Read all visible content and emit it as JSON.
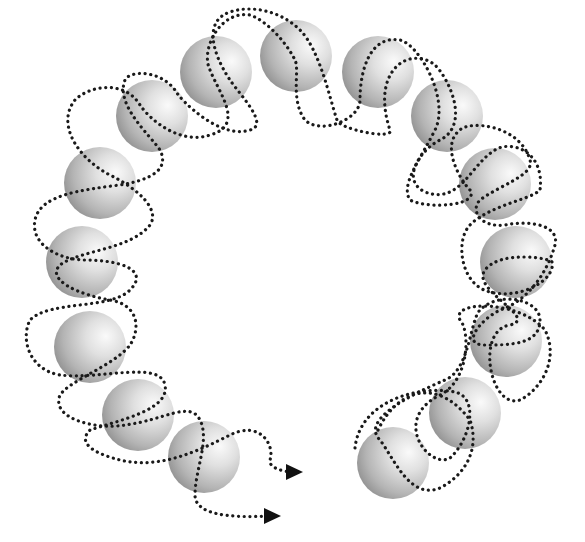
{
  "diagram": {
    "type": "open ring of beads with two dotted helical strands",
    "background": "#ffffff",
    "sphere": {
      "count": 15,
      "radius": 36,
      "highlight_color": "#f7f7f7",
      "mid_color": "#cfcfcf",
      "shadow_color": "#8e8e8e"
    },
    "spheres": [
      {
        "id": 1,
        "cx": 393,
        "cy": 463
      },
      {
        "id": 2,
        "cx": 465,
        "cy": 413
      },
      {
        "id": 3,
        "cx": 506,
        "cy": 341
      },
      {
        "id": 4,
        "cx": 516,
        "cy": 262
      },
      {
        "id": 5,
        "cx": 495,
        "cy": 184
      },
      {
        "id": 6,
        "cx": 447,
        "cy": 116
      },
      {
        "id": 7,
        "cx": 378,
        "cy": 72
      },
      {
        "id": 8,
        "cx": 296,
        "cy": 56
      },
      {
        "id": 9,
        "cx": 216,
        "cy": 72
      },
      {
        "id": 10,
        "cx": 152,
        "cy": 116
      },
      {
        "id": 11,
        "cx": 100,
        "cy": 183
      },
      {
        "id": 12,
        "cx": 82,
        "cy": 262
      },
      {
        "id": 13,
        "cx": 90,
        "cy": 347
      },
      {
        "id": 14,
        "cx": 138,
        "cy": 415
      },
      {
        "id": 15,
        "cx": 204,
        "cy": 457
      }
    ],
    "strands": [
      {
        "name": "strand-a",
        "style": "dotted",
        "color": "#1a1a1a",
        "end_arrow": {
          "x": 300,
          "y": 472
        }
      },
      {
        "name": "strand-b",
        "style": "dotted",
        "color": "#1a1a1a",
        "end_arrow": {
          "x": 278,
          "y": 516
        }
      }
    ],
    "labels": []
  }
}
